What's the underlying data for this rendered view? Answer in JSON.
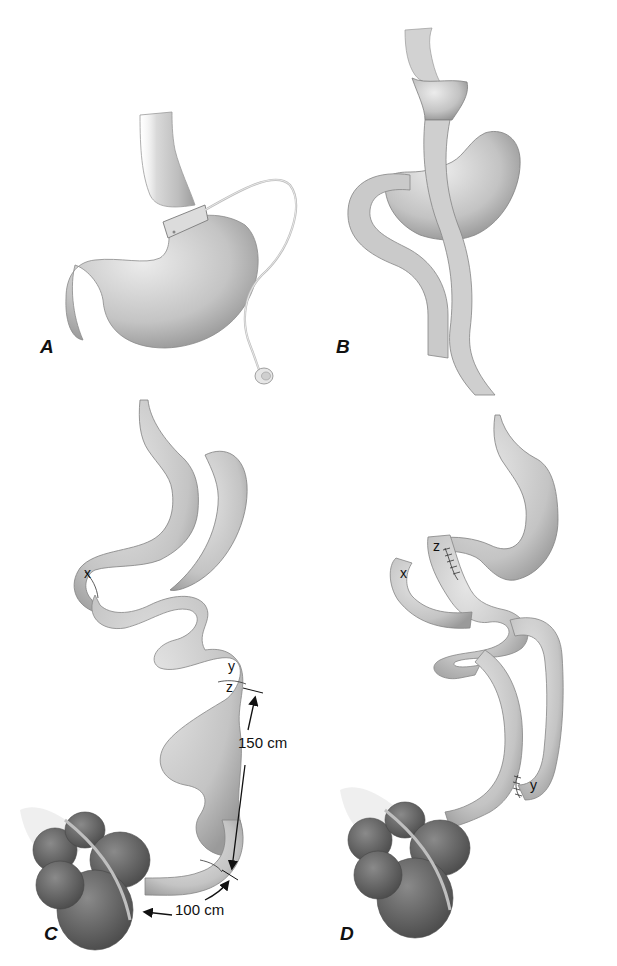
{
  "figure": {
    "background": "#ffffff",
    "colors": {
      "organ_fill": "#c9c9c9",
      "organ_light": "#e4e4e4",
      "organ_shadow": "#9a9a9a",
      "outline": "#7a7a7a",
      "colon_fill": "#6e6e6e",
      "colon_dark": "#4f4f4f",
      "text": "#111111"
    },
    "panels": [
      {
        "id": "A",
        "label": "A",
        "depicts": "adjustable gastric band with tubing and port"
      },
      {
        "id": "B",
        "label": "B",
        "depicts": "Roux-en-Y gastric bypass"
      },
      {
        "id": "C",
        "label": "C",
        "depicts": "biliopancreatic diversion with marked segments",
        "annotations": {
          "x": "x",
          "y": "y",
          "z": "z",
          "length_1": "150 cm",
          "length_2": "100 cm"
        }
      },
      {
        "id": "D",
        "label": "D",
        "depicts": "reconstructed bypass with anastomoses",
        "annotations": {
          "x": "x",
          "y": "y",
          "z": "z"
        }
      }
    ]
  }
}
